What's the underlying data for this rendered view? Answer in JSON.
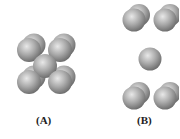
{
  "figures": [
    {
      "id": "A",
      "label": "(A)",
      "description": "body-centered arrangement with central sphere among corner sphere pairs"
    },
    {
      "id": "B",
      "label": "(B)",
      "description": "expanded view with central sphere separated from corner sphere pairs"
    }
  ],
  "colors": {
    "sphere_light": "#e6e6e6",
    "sphere_mid": "#a8a8a8",
    "sphere_dark": "#6e6e6e",
    "label": "#222222"
  }
}
